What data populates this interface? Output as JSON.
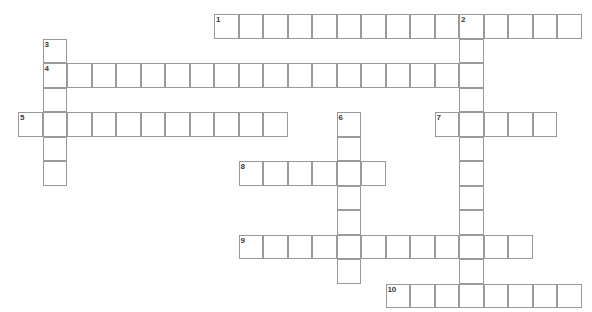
{
  "puzzle": {
    "type": "crossword-grid",
    "title": "Crossword Puzzle Grid",
    "width": 592,
    "height": 312,
    "cell_size": 24.5,
    "origin_x": 18,
    "origin_y": 14,
    "colors": {
      "cell_border": "#9a9a9a",
      "cell_fill": "#ffffff",
      "number_text": "#3a3a3a",
      "background": "#ffffff"
    },
    "entries": [
      {
        "number": "1",
        "direction": "across",
        "row": 0,
        "col": 8,
        "length": 15
      },
      {
        "number": "2",
        "direction": "down",
        "row": 0,
        "col": 18,
        "length": 12
      },
      {
        "number": "3",
        "direction": "down",
        "row": 1,
        "col": 1,
        "length": 6
      },
      {
        "number": "4",
        "direction": "across",
        "row": 2,
        "col": 1,
        "length": 18
      },
      {
        "number": "5",
        "direction": "across",
        "row": 4,
        "col": 0,
        "length": 11
      },
      {
        "number": "6",
        "direction": "down",
        "row": 4,
        "col": 13,
        "length": 7
      },
      {
        "number": "7",
        "direction": "across",
        "row": 4,
        "col": 17,
        "length": 5
      },
      {
        "number": "8",
        "direction": "across",
        "row": 6,
        "col": 9,
        "length": 6
      },
      {
        "number": "9",
        "direction": "across",
        "row": 9,
        "col": 9,
        "length": 12
      },
      {
        "number": "10",
        "direction": "across",
        "row": 11,
        "col": 15,
        "length": 8
      }
    ]
  }
}
